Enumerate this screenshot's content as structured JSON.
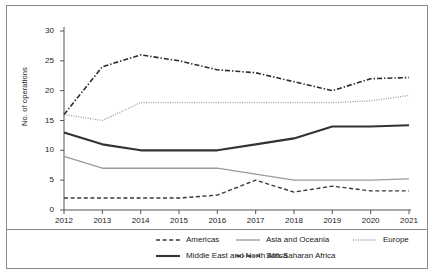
{
  "chart_data": {
    "type": "line",
    "title": "",
    "xlabel": "",
    "ylabel": "No. of operations",
    "x": [
      2012,
      2013,
      2014,
      2015,
      2016,
      2017,
      2018,
      2019,
      2020,
      2021
    ],
    "xtick_labels": [
      "2012",
      "2013",
      "2014",
      "2015",
      "2016",
      "2017",
      "2018",
      "2019",
      "2020",
      "2021"
    ],
    "ytick_labels": [
      "0",
      "5",
      "10",
      "15",
      "20",
      "25",
      "30"
    ],
    "ytick_values": [
      0,
      5,
      10,
      15,
      20,
      25,
      30
    ],
    "ylim": [
      0,
      30
    ],
    "xlim": [
      2012,
      2021
    ],
    "grid": false,
    "legend_position": "bottom",
    "series": [
      {
        "name": "Americas",
        "style": "dashed",
        "color": "#3a3a3a",
        "width": 1.4,
        "values": [
          2,
          2,
          2,
          2,
          2.5,
          5,
          3,
          4,
          3.2,
          3.2
        ]
      },
      {
        "name": "Asia and Oceania",
        "style": "solid",
        "color": "#9a9a9a",
        "width": 1.3,
        "values": [
          9,
          7,
          7,
          7,
          7,
          6,
          5,
          5,
          5,
          5.2
        ]
      },
      {
        "name": "Europe",
        "style": "dotted",
        "color": "#9a9a9a",
        "width": 1.3,
        "values": [
          16,
          15,
          18,
          18,
          18,
          18,
          18,
          18,
          18.3,
          19.2
        ]
      },
      {
        "name": "Middle East and North Africa",
        "style": "solid",
        "color": "#333333",
        "width": 2.1,
        "values": [
          13,
          11,
          10,
          10,
          10,
          11,
          12,
          14,
          14,
          14.2
        ]
      },
      {
        "name": "Sub-Saharan Africa",
        "style": "dashdot",
        "color": "#2b2b2b",
        "width": 1.6,
        "values": [
          16,
          24,
          26,
          25,
          23.5,
          23,
          21.5,
          20,
          22,
          22.2
        ]
      }
    ]
  },
  "legend": {
    "items": [
      {
        "label": "Americas"
      },
      {
        "label": "Asia and Oceania"
      },
      {
        "label": "Europe"
      },
      {
        "label": "Middle East and North Africa"
      },
      {
        "label": "Sub-Saharan Africa"
      }
    ]
  },
  "colors": {
    "frame": "#8a8a8a",
    "axis": "#555555",
    "text": "#222222",
    "background": "#ffffff"
  }
}
